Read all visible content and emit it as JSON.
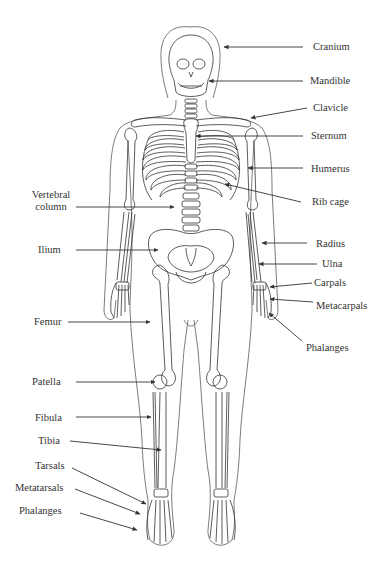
{
  "diagram": {
    "labels_right": [
      {
        "id": "cranium",
        "text": "Cranium"
      },
      {
        "id": "mandible",
        "text": "Mandible"
      },
      {
        "id": "clavicle",
        "text": "Clavicle"
      },
      {
        "id": "sternum",
        "text": "Sternum"
      },
      {
        "id": "humerus",
        "text": "Humerus"
      },
      {
        "id": "rib-cage",
        "text": "Rib cage"
      },
      {
        "id": "radius",
        "text": "Radius"
      },
      {
        "id": "ulna",
        "text": "Ulna"
      },
      {
        "id": "carpals",
        "text": "Carpals"
      },
      {
        "id": "metacarpals",
        "text": "Metacarpals"
      },
      {
        "id": "phalanges-hand",
        "text": "Phalanges"
      }
    ],
    "labels_left": [
      {
        "id": "vertebral-column",
        "text_line1": "Vertebral",
        "text_line2": "column"
      },
      {
        "id": "ilium",
        "text": "Ilium"
      },
      {
        "id": "femur",
        "text": "Femur"
      },
      {
        "id": "patella",
        "text": "Patella"
      },
      {
        "id": "fibula",
        "text": "Fibula"
      },
      {
        "id": "tibia",
        "text": "Tibia"
      },
      {
        "id": "tarsals",
        "text": "Tarsals"
      },
      {
        "id": "metatarsals",
        "text": "Metatarsals"
      },
      {
        "id": "phalanges-foot",
        "text": "Phalanges"
      }
    ]
  }
}
